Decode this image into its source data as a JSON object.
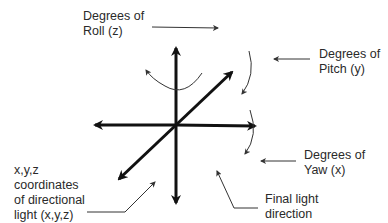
{
  "diagram": {
    "labels": {
      "roll": {
        "line1": "Degrees of",
        "line2": "Roll (z)"
      },
      "pitch": {
        "line1": "Degrees of",
        "line2": "Pitch (y)"
      },
      "yaw": {
        "line1": "Degrees of",
        "line2": "Yaw (x)"
      },
      "final_light": {
        "line1": "Final light",
        "line2": "direction"
      },
      "coordinates": {
        "line1": "x,y,z",
        "line2": "coordinates",
        "line3": "of directional",
        "line4": "light (x,y,z)"
      }
    },
    "colors": {
      "axis": "#111111",
      "thin_line": "#333333",
      "text": "#2a2a2a",
      "background": "#ffffff"
    }
  }
}
